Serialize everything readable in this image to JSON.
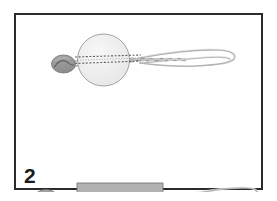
{
  "figure": {
    "step_label": "2",
    "caption_position": "bottom-left",
    "frame": {
      "border_color": "#2b2b2b",
      "border_width_px": 2,
      "background_color": "#ffffff",
      "outer_background_color": "#ffffff"
    },
    "colors": {
      "oval_fill": "#9a9a9a",
      "oval_stroke": "#6e6e6e",
      "circle_fill": "#f0f0f0",
      "circle_stroke": "#8c8c8c",
      "rect_fill": "#b2b2b2",
      "rect_stroke": "#6e6e6e",
      "stitch_color": "#5a5a5a",
      "cord_color": "#9d9d9d",
      "cord_highlight": "#d8d8d8",
      "number_color": "#1c1c1c"
    },
    "assemblies": [
      {
        "name": "circular-pad-assembly",
        "label": "circle",
        "body_shape": "circle",
        "body_cx": 175,
        "body_cy": 90,
        "body_r": 52,
        "oval_cx": 95,
        "oval_cy": 98,
        "oval_rx": 24,
        "oval_ry": 18,
        "stitch_rows": 2,
        "cord_end_x": 440
      },
      {
        "name": "rectangular-pad-assembly",
        "label": "rectangle",
        "body_shape": "rectangle",
        "body_x": 122,
        "body_y": 336,
        "body_w": 172,
        "body_h": 62,
        "oval_cx": 60,
        "oval_cy": 367,
        "oval_rx": 24,
        "oval_ry": 18,
        "stitch_rows": 2,
        "cord_end_x": 455
      }
    ]
  }
}
